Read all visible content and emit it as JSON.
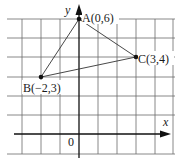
{
  "figure": {
    "axes": {
      "x_label": "x",
      "y_label": "y",
      "origin_label": "0",
      "x_range": [
        -4,
        4
      ],
      "y_range": [
        -1,
        6
      ],
      "grid": true,
      "unit_px": 19.2
    },
    "points": [
      {
        "name": "A",
        "x": 0,
        "y": 6,
        "label": "A(0,6)"
      },
      {
        "name": "B",
        "x": -2,
        "y": 3,
        "label": "B(−2,3)"
      },
      {
        "name": "C",
        "x": 3,
        "y": 4,
        "label": "C(3,4)"
      }
    ],
    "triangle": [
      "A",
      "B",
      "C"
    ],
    "colors": {
      "grid": "#555555",
      "axis": "#111111",
      "line": "#333333",
      "point": "#111111"
    }
  }
}
